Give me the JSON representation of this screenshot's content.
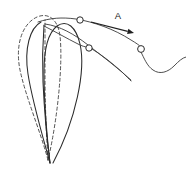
{
  "figure": {
    "title": "",
    "width": 186,
    "height": 176,
    "background_color": "#ffffff",
    "stroke_color": "#2b2b2b",
    "dashed_stroke_color": "#4a4a4a",
    "annotations": [
      {
        "name": "label-a",
        "text": "A",
        "x": 118,
        "y": 16
      }
    ],
    "arrow": {
      "name": "direction-arrow",
      "label": "A",
      "from_x": 91,
      "from_y": 22,
      "to_x": 134,
      "to_y": 33,
      "direction": "right-down"
    },
    "shapes": {
      "solid_petal_outer": "M 50 163 C 46 128 44 96 44 72 C 44 50 48 33 57 26 C 67 19 76 27 80 44 C 86 70 76 120 53 163",
      "solid_petal_inner": "M 50 163 C 46 132 44 104 43 82 C 42 58 43 38 44 25",
      "solid_petal_left": "M 50 163 C 42 134 32 100 28 74 C 24 48 30 28 41 22",
      "dashed_petal_outer": "M 48 160 C 40 130 26 98 20 70 C 15 45 22 24 37 17 C 49 12 58 20 60 36 C 63 62 58 118 48 160",
      "dashed_petal_inner": "M 48 160 C 46 130 45 100 45 76 C 45 52 45 32 45 20",
      "upper_curve": "M 38 22 C 50 18 62 17 76 19 C 94 22 114 29 131 40 C 136 43 139 45 141 47",
      "upper_curve_tail": "M 141 52 C 144 58 147 66 153 70 C 160 75 168 72 174 66 C 179 61 182 58 186 57",
      "lower_curve": "M 44 26 C 56 32 66 38 78 44 C 82 46 85 47 87 47",
      "lower_curve_tail": "M 92 49 C 102 55 112 63 122 72 C 126 76 129 79 131 81",
      "mid_curve": "M 45 24 C 60 26 74 34 88 45 C 102 56 118 68 131 80"
    },
    "nodes": [
      {
        "name": "node-loop-left",
        "cx": 44,
        "cy": 18,
        "r": 3.2
      },
      {
        "name": "node-loop-top",
        "cx": 80,
        "cy": 20,
        "r": 3.2
      },
      {
        "name": "node-loop-middle",
        "cx": 89,
        "cy": 48,
        "r": 3.2
      },
      {
        "name": "node-loop-right",
        "cx": 141,
        "cy": 49,
        "r": 3.4
      }
    ]
  }
}
